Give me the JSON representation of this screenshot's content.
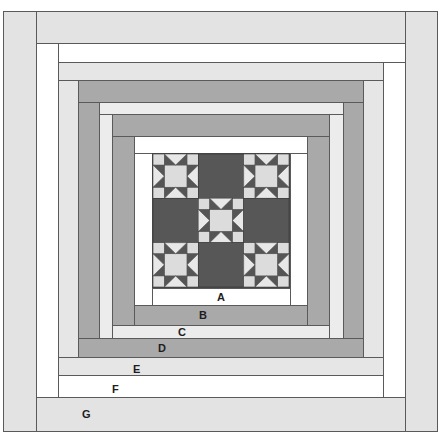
{
  "diagram": {
    "colors": {
      "white": "#ffffff",
      "light_gray": "#e3e3e3",
      "pale_gray": "#ececec",
      "mid_gray": "#a9a9a9",
      "dark_gray": "#555555",
      "star_light": "#dcdcdc",
      "outline": "#5a5a5a"
    },
    "center_block": {
      "name": "Nine-patch with Ohio Star blocks",
      "grid": [
        [
          "star",
          "dark",
          "star"
        ],
        [
          "dark",
          "star",
          "dark"
        ],
        [
          "star",
          "dark",
          "star"
        ]
      ]
    },
    "borders": [
      {
        "label": "A",
        "tone": "white"
      },
      {
        "label": "B",
        "tone": "mid_gray"
      },
      {
        "label": "C",
        "tone": "pale_gray"
      },
      {
        "label": "D",
        "tone": "mid_gray"
      },
      {
        "label": "E",
        "tone": "light_gray"
      },
      {
        "label": "F",
        "tone": "white"
      },
      {
        "label": "G",
        "tone": "light_gray"
      }
    ]
  }
}
